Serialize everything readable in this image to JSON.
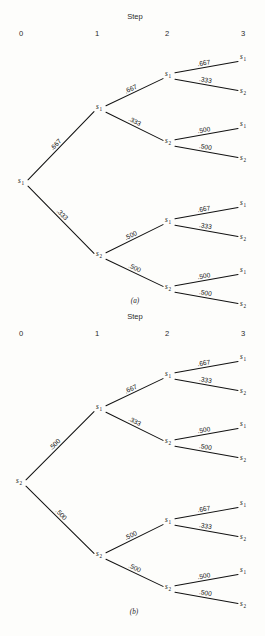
{
  "figure": {
    "width": 265,
    "height": 636,
    "background": "#fdfdfb",
    "line_color": "#121212"
  },
  "panels": [
    {
      "id": "a",
      "caption": "(a)",
      "caption_pos": {
        "x": 135,
        "y": 303
      },
      "header": {
        "title": "Step",
        "title_pos": {
          "x": 135,
          "y": 19
        }
      },
      "columns": [
        {
          "label": "0",
          "x": 21,
          "y": 36
        },
        {
          "label": "1",
          "x": 97,
          "y": 36
        },
        {
          "label": "2",
          "x": 167,
          "y": 36
        },
        {
          "label": "3",
          "x": 243,
          "y": 36
        }
      ],
      "nodes": [
        {
          "id": "a-r",
          "state": "s",
          "sub": "1",
          "x": 21,
          "y": 183,
          "level": 0
        },
        {
          "id": "a-1a",
          "state": "s",
          "sub": "1",
          "x": 99,
          "y": 109,
          "level": 1
        },
        {
          "id": "a-1b",
          "state": "s",
          "sub": "2",
          "x": 99,
          "y": 256,
          "level": 1
        },
        {
          "id": "a-2a",
          "state": "s",
          "sub": "1",
          "x": 168,
          "y": 76,
          "level": 2
        },
        {
          "id": "a-2b",
          "state": "s",
          "sub": "2",
          "x": 168,
          "y": 143,
          "level": 2
        },
        {
          "id": "a-2c",
          "state": "s",
          "sub": "1",
          "x": 168,
          "y": 222,
          "level": 2
        },
        {
          "id": "a-2d",
          "state": "s",
          "sub": "2",
          "x": 168,
          "y": 289,
          "level": 2
        },
        {
          "id": "a-3a",
          "state": "s",
          "sub": "1",
          "x": 243,
          "y": 59,
          "level": 3
        },
        {
          "id": "a-3b",
          "state": "s",
          "sub": "2",
          "x": 243,
          "y": 93,
          "level": 3
        },
        {
          "id": "a-3c",
          "state": "s",
          "sub": "1",
          "x": 243,
          "y": 126,
          "level": 3
        },
        {
          "id": "a-3d",
          "state": "s",
          "sub": "2",
          "x": 243,
          "y": 160,
          "level": 3
        },
        {
          "id": "a-3e",
          "state": "s",
          "sub": "1",
          "x": 243,
          "y": 205,
          "level": 3
        },
        {
          "id": "a-3f",
          "state": "s",
          "sub": "2",
          "x": 243,
          "y": 239,
          "level": 3
        },
        {
          "id": "a-3g",
          "state": "s",
          "sub": "1",
          "x": 243,
          "y": 272,
          "level": 3
        },
        {
          "id": "a-3h",
          "state": "s",
          "sub": "2",
          "x": 243,
          "y": 306,
          "level": 3
        }
      ],
      "edges": [
        {
          "from": "a-r",
          "to": "a-1a",
          "label": ".667"
        },
        {
          "from": "a-r",
          "to": "a-1b",
          "label": ".333"
        },
        {
          "from": "a-1a",
          "to": "a-2a",
          "label": ".667"
        },
        {
          "from": "a-1a",
          "to": "a-2b",
          "label": ".333"
        },
        {
          "from": "a-1b",
          "to": "a-2c",
          "label": ".500"
        },
        {
          "from": "a-1b",
          "to": "a-2d",
          "label": ".500"
        },
        {
          "from": "a-2a",
          "to": "a-3a",
          "label": ".667"
        },
        {
          "from": "a-2a",
          "to": "a-3b",
          "label": ".333"
        },
        {
          "from": "a-2b",
          "to": "a-3c",
          "label": ".500"
        },
        {
          "from": "a-2b",
          "to": "a-3d",
          "label": ".500"
        },
        {
          "from": "a-2c",
          "to": "a-3e",
          "label": ".667"
        },
        {
          "from": "a-2c",
          "to": "a-3f",
          "label": ".333"
        },
        {
          "from": "a-2d",
          "to": "a-3g",
          "label": ".500"
        },
        {
          "from": "a-2d",
          "to": "a-3h",
          "label": ".500"
        }
      ]
    },
    {
      "id": "b",
      "caption": "(b)",
      "caption_pos": {
        "x": 134,
        "y": 614
      },
      "header": {
        "title": "Step",
        "title_pos": {
          "x": 135,
          "y": 319
        }
      },
      "columns": [
        {
          "label": "0",
          "x": 21,
          "y": 336
        },
        {
          "label": "1",
          "x": 97,
          "y": 336
        },
        {
          "label": "2",
          "x": 167,
          "y": 336
        },
        {
          "label": "3",
          "x": 243,
          "y": 336
        }
      ],
      "nodes": [
        {
          "id": "b-r",
          "state": "s",
          "sub": "2",
          "x": 19,
          "y": 483,
          "level": 0
        },
        {
          "id": "b-1a",
          "state": "s",
          "sub": "1",
          "x": 99,
          "y": 409,
          "level": 1
        },
        {
          "id": "b-1b",
          "state": "s",
          "sub": "2",
          "x": 99,
          "y": 556,
          "level": 1
        },
        {
          "id": "b-2a",
          "state": "s",
          "sub": "1",
          "x": 168,
          "y": 376,
          "level": 2
        },
        {
          "id": "b-2b",
          "state": "s",
          "sub": "2",
          "x": 168,
          "y": 443,
          "level": 2
        },
        {
          "id": "b-2c",
          "state": "s",
          "sub": "1",
          "x": 168,
          "y": 522,
          "level": 2
        },
        {
          "id": "b-2d",
          "state": "s",
          "sub": "2",
          "x": 168,
          "y": 589,
          "level": 2
        },
        {
          "id": "b-3a",
          "state": "s",
          "sub": "1",
          "x": 243,
          "y": 359,
          "level": 3
        },
        {
          "id": "b-3b",
          "state": "s",
          "sub": "2",
          "x": 243,
          "y": 393,
          "level": 3
        },
        {
          "id": "b-3c",
          "state": "s",
          "sub": "1",
          "x": 243,
          "y": 426,
          "level": 3
        },
        {
          "id": "b-3d",
          "state": "s",
          "sub": "2",
          "x": 243,
          "y": 460,
          "level": 3
        },
        {
          "id": "b-3e",
          "state": "s",
          "sub": "1",
          "x": 243,
          "y": 505,
          "level": 3
        },
        {
          "id": "b-3f",
          "state": "s",
          "sub": "2",
          "x": 243,
          "y": 539,
          "level": 3
        },
        {
          "id": "b-3g",
          "state": "s",
          "sub": "1",
          "x": 243,
          "y": 572,
          "level": 3
        },
        {
          "id": "b-3h",
          "state": "s",
          "sub": "2",
          "x": 243,
          "y": 606,
          "level": 3
        }
      ],
      "edges": [
        {
          "from": "b-r",
          "to": "b-1a",
          "label": ".500"
        },
        {
          "from": "b-r",
          "to": "b-1b",
          "label": ".500"
        },
        {
          "from": "b-1a",
          "to": "b-2a",
          "label": ".667"
        },
        {
          "from": "b-1a",
          "to": "b-2b",
          "label": ".333"
        },
        {
          "from": "b-1b",
          "to": "b-2c",
          "label": ".500"
        },
        {
          "from": "b-1b",
          "to": "b-2d",
          "label": ".500"
        },
        {
          "from": "b-2a",
          "to": "b-3a",
          "label": ".667"
        },
        {
          "from": "b-2a",
          "to": "b-3b",
          "label": ".333"
        },
        {
          "from": "b-2b",
          "to": "b-3c",
          "label": ".500"
        },
        {
          "from": "b-2b",
          "to": "b-3d",
          "label": ".500"
        },
        {
          "from": "b-2c",
          "to": "b-3e",
          "label": ".667"
        },
        {
          "from": "b-2c",
          "to": "b-3f",
          "label": ".333"
        },
        {
          "from": "b-2d",
          "to": "b-3g",
          "label": ".500"
        },
        {
          "from": "b-2d",
          "to": "b-3h",
          "label": ".500"
        }
      ]
    }
  ]
}
